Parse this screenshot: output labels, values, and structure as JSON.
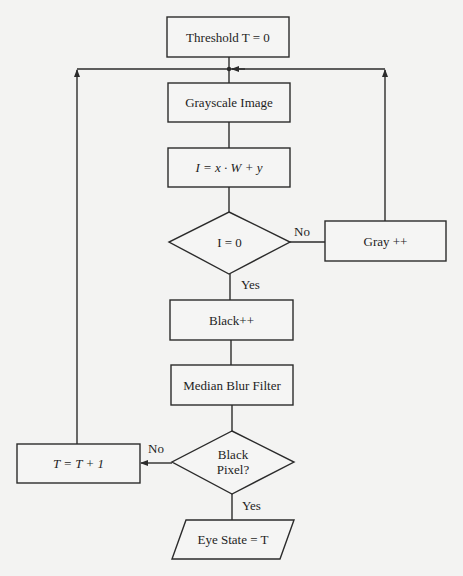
{
  "diagram": {
    "type": "flowchart",
    "colors": {
      "background": "#f3f3f2",
      "stroke": "#2b2b2b",
      "text": "#1e1e1e"
    },
    "nodes": {
      "threshold": {
        "shape": "process",
        "label": "Threshold T = 0"
      },
      "grayscale": {
        "shape": "process",
        "label": "Grayscale Image"
      },
      "index": {
        "shape": "process",
        "label": "I = x · W + y"
      },
      "is_zero": {
        "shape": "decision",
        "label": "I = 0"
      },
      "gray_inc": {
        "shape": "process",
        "label": "Gray ++"
      },
      "black_inc": {
        "shape": "process",
        "label": "Black++"
      },
      "median": {
        "shape": "process",
        "label": "Median Blur Filter"
      },
      "black_pixel": {
        "shape": "decision",
        "label_line1": "Black",
        "label_line2": "Pixel?"
      },
      "t_inc": {
        "shape": "process",
        "label": "T = T + 1"
      },
      "eye_state": {
        "shape": "io",
        "label": "Eye State = T"
      }
    },
    "edges": [
      {
        "from": "threshold",
        "to": "grayscale",
        "label": ""
      },
      {
        "from": "grayscale",
        "to": "index",
        "label": ""
      },
      {
        "from": "index",
        "to": "is_zero",
        "label": ""
      },
      {
        "from": "is_zero",
        "to": "gray_inc",
        "label": "No"
      },
      {
        "from": "gray_inc",
        "to": "grayscale",
        "label": ""
      },
      {
        "from": "is_zero",
        "to": "black_inc",
        "label": "Yes"
      },
      {
        "from": "black_inc",
        "to": "median",
        "label": ""
      },
      {
        "from": "median",
        "to": "black_pixel",
        "label": ""
      },
      {
        "from": "black_pixel",
        "to": "t_inc",
        "label": "No"
      },
      {
        "from": "t_inc",
        "to": "grayscale",
        "label": ""
      },
      {
        "from": "black_pixel",
        "to": "eye_state",
        "label": "Yes"
      }
    ],
    "edge_labels": {
      "is_zero_no": "No",
      "is_zero_yes": "Yes",
      "black_pixel_no": "No",
      "black_pixel_yes": "Yes"
    }
  }
}
